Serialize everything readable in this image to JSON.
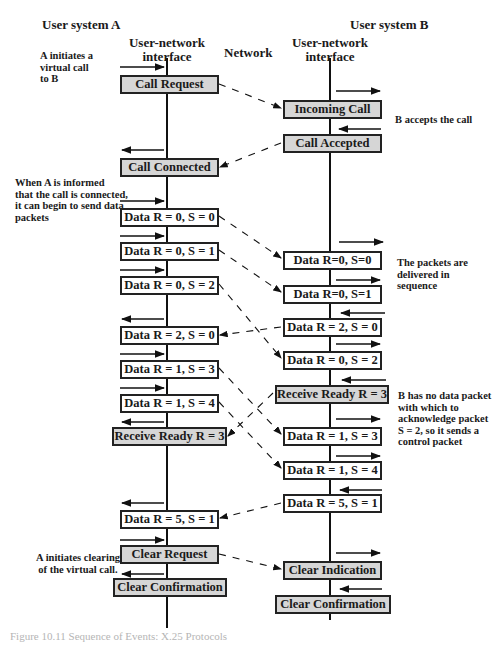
{
  "headers": {
    "user_a": "User system A",
    "iface_a": "User-network\ninterface",
    "network": "Network",
    "user_b": "User system B",
    "iface_b": "User-network\ninterface"
  },
  "notes": {
    "a_initiates": "A initiates a\nvirtual call\nto B",
    "b_accepts": "B accepts the call",
    "a_informed": "When A is informed\nthat the call is connected,\nit can begin to send data\npackets",
    "in_sequence": "The packets are\ndelivered in\nsequence",
    "b_no_data": "B has no data packet\nwith which to\nacknowledge packet\nS = 2, so it sends a\ncontrol packet",
    "a_clearing": "A initiates clearing\nof the virtual call."
  },
  "side_a": [
    {
      "label": "Call Request",
      "type": "control"
    },
    {
      "label": "Call Connected",
      "type": "control"
    },
    {
      "label": "Data R = 0, S = 0",
      "type": "data"
    },
    {
      "label": "Data R = 0, S = 1",
      "type": "data"
    },
    {
      "label": "Data R = 0, S = 2",
      "type": "data"
    },
    {
      "label": "Data R = 2, S = 0",
      "type": "data"
    },
    {
      "label": "Data R = 1, S = 3",
      "type": "data"
    },
    {
      "label": "Data R = 1, S = 4",
      "type": "data"
    },
    {
      "label": "Receive Ready R = 3",
      "type": "control"
    },
    {
      "label": "Data R = 5, S = 1",
      "type": "data"
    },
    {
      "label": "Clear Request",
      "type": "control"
    },
    {
      "label": "Clear Confirmation",
      "type": "control"
    }
  ],
  "side_b": [
    {
      "label": "Incoming Call",
      "type": "control"
    },
    {
      "label": "Call Accepted",
      "type": "control"
    },
    {
      "label": "Data R=0, S=0",
      "type": "data"
    },
    {
      "label": "Data R=0, S=1",
      "type": "data"
    },
    {
      "label": "Data R = 2, S = 0",
      "type": "data"
    },
    {
      "label": "Data R = 0, S = 2",
      "type": "data"
    },
    {
      "label": "Receive Ready R = 3",
      "type": "control"
    },
    {
      "label": "Data R = 1, S = 3",
      "type": "data"
    },
    {
      "label": "Data R = 1, S = 4",
      "type": "data"
    },
    {
      "label": "Data R = 5, S = 1",
      "type": "data"
    },
    {
      "label": "Clear Indication",
      "type": "control"
    },
    {
      "label": "Clear Confirmation",
      "type": "control"
    }
  ],
  "caption": "Figure 10.11 Sequence of Events: X.25 Protocols",
  "colors": {
    "control_fill": "#d6d6d6",
    "data_fill": "#ffffff",
    "line": "#222222"
  }
}
